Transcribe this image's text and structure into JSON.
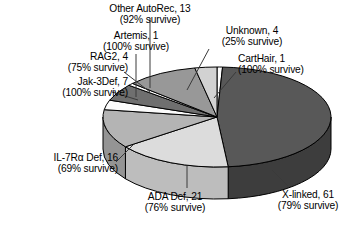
{
  "chart_data": {
    "type": "pie",
    "title": "",
    "subtitle": "",
    "xlabel": "",
    "ylabel": "",
    "legend_position": "none",
    "grid": false,
    "three_d": true,
    "total": 128,
    "units": "patients",
    "categories": [
      "X-linked",
      "ADA Def",
      "IL-7Rα Def",
      "RAG2",
      "Jak-3Def",
      "Artemis",
      "Other AutoRec",
      "Unknown",
      "CartHair"
    ],
    "values": [
      61,
      21,
      16,
      4,
      7,
      1,
      13,
      4,
      1
    ],
    "survival_percent": [
      79,
      76,
      69,
      75,
      100,
      100,
      92,
      25,
      100
    ],
    "slices": [
      {
        "key": "carthair",
        "name": "CartHair",
        "count": 1,
        "survive_pct": 100,
        "label_line1": "CartHair, 1",
        "label_line2": "(100% survive)",
        "color": "#fdfdfd",
        "side_color": "#d8d8d8"
      },
      {
        "key": "x-linked",
        "name": "X-linked",
        "count": 61,
        "survive_pct": 79,
        "label_line1": "X-linked, 61",
        "label_line2": "(79% survive)",
        "color": "#585858",
        "side_color": "#3d3d3d"
      },
      {
        "key": "ada-def",
        "name": "ADA Def",
        "count": 21,
        "survive_pct": 76,
        "label_line1": "ADA Def, 21",
        "label_line2": "(76% survive)",
        "color": "#dcdcdc",
        "side_color": "#bdbdbd"
      },
      {
        "key": "il7ra-def",
        "name": "IL-7Rα Def",
        "count": 16,
        "survive_pct": 69,
        "label_line1": "IL-7Rα Def, 16",
        "label_line2": "(69% survive)",
        "color": "#b4b4b4",
        "side_color": "#949494"
      },
      {
        "key": "rag2",
        "name": "RAG2",
        "count": 4,
        "survive_pct": 75,
        "label_line1": "RAG2, 4",
        "label_line2": "(75% survive)",
        "color": "#fbfbfb",
        "side_color": "#d4d4d4"
      },
      {
        "key": "jak-3def",
        "name": "Jak-3Def",
        "count": 7,
        "survive_pct": 100,
        "label_line1": "Jak-3Def, 7",
        "label_line2": "(100% survive)",
        "color": "#6f6f6f",
        "side_color": "#535353"
      },
      {
        "key": "artemis",
        "name": "Artemis",
        "count": 1,
        "survive_pct": 100,
        "label_line1": "Artemis, 1",
        "label_line2": "(100% survive)",
        "color": "#ffffff",
        "side_color": "#dadada"
      },
      {
        "key": "other-autorec",
        "name": "Other AutoRec",
        "count": 13,
        "survive_pct": 92,
        "label_line1": "Other AutoRec, 13",
        "label_line2": "(92% survive)",
        "color": "#989898",
        "side_color": "#787878"
      },
      {
        "key": "unknown",
        "name": "Unknown",
        "count": 4,
        "survive_pct": 25,
        "label_line1": "Unknown, 4",
        "label_line2": "(25% survive)",
        "color": "#d2d2d2",
        "side_color": "#b0b0b0"
      }
    ],
    "colors": {
      "outline": "#000000",
      "leader_line": "#3a3a3a",
      "text": "#000000",
      "background": "#ffffff"
    }
  }
}
